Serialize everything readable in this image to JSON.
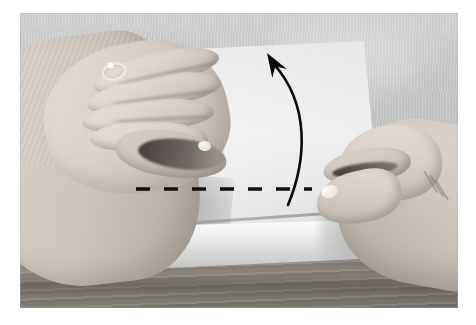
{
  "scene": {
    "title": "Hands folding a sheet of paper on a wooden table",
    "caption": "",
    "photo": {
      "left": 20,
      "top": 13,
      "width": 438,
      "height": 295,
      "margin_color": "#ffffff"
    },
    "palette": {
      "background_wall": "#c6c6c6",
      "table_wood": "#8f8880",
      "paper_white": "#f7f7f7",
      "skin": "#d6cec6",
      "annotation_black": "#0b0b0b"
    }
  },
  "objects": {
    "background": {
      "name": "background-wall",
      "description": "Light gray textured backdrop"
    },
    "table": {
      "name": "wooden-table",
      "description": "Wood grain table surface, lower third of photo"
    },
    "paper_sheet": {
      "name": "paper-sheet",
      "description": "Large white square sheet of paper lying on the table"
    },
    "paper_flap": {
      "name": "paper-lifted-flap",
      "description": "Lower front edge of the sheet lifted slightly"
    },
    "left_hand": {
      "name": "left-hand",
      "description": "Left hand flat, fingers pressing the top of the sheet",
      "ring": "plain band ring on ring finger"
    },
    "right_hand": {
      "name": "right-hand",
      "description": "Right hand pinching the right edge of the sheet with thumb and index finger"
    }
  },
  "annotations": {
    "fold_line": {
      "name": "dashed-fold-line",
      "type": "dashed-line",
      "color": "#101010",
      "dash_count": 7,
      "x_start": 116,
      "x_end": 292,
      "y": 176,
      "stroke_width": 3.4,
      "meaning": "Fold along this line"
    },
    "motion_arrow": {
      "name": "curved-motion-arrow",
      "type": "curved-arrow",
      "color": "#0b0b0b",
      "direction": "upward",
      "tail": {
        "x": 268,
        "y": 192
      },
      "control": {
        "x": 290,
        "y": 110
      },
      "tip": {
        "x": 247,
        "y": 40
      },
      "stroke_width": 2.6,
      "meaning": "Lift and rotate the lower edge upward"
    }
  }
}
